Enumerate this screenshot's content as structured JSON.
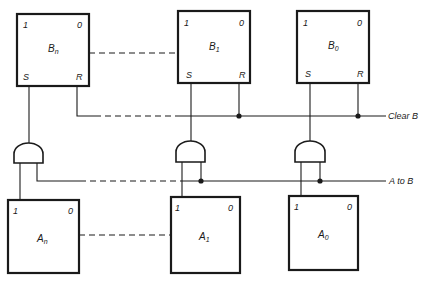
{
  "diagram": {
    "type": "logic-circuit",
    "b_register": [
      {
        "id": "Bn",
        "name": "B",
        "subscript": "n",
        "pin_top_left": "1",
        "pin_top_right": "0",
        "pin_bottom_left": "S",
        "pin_bottom_right": "R"
      },
      {
        "id": "B1",
        "name": "B",
        "subscript": "1",
        "pin_top_left": "1",
        "pin_top_right": "0",
        "pin_bottom_left": "S",
        "pin_bottom_right": "R"
      },
      {
        "id": "B0",
        "name": "B",
        "subscript": "0",
        "pin_top_left": "1",
        "pin_top_right": "0",
        "pin_bottom_left": "S",
        "pin_bottom_right": "R"
      }
    ],
    "a_register": [
      {
        "id": "An",
        "name": "A",
        "subscript": "n",
        "pin_top_left": "1",
        "pin_top_right": "0"
      },
      {
        "id": "A1",
        "name": "A",
        "subscript": "1",
        "pin_top_left": "1",
        "pin_top_right": "0"
      },
      {
        "id": "A0",
        "name": "A",
        "subscript": "0",
        "pin_top_left": "1",
        "pin_top_right": "0"
      }
    ],
    "gates": [
      {
        "id": "AND_n",
        "type": "AND",
        "inputs": [
          "An.1",
          "A to B"
        ],
        "output": "Bn.S"
      },
      {
        "id": "AND_1",
        "type": "AND",
        "inputs": [
          "A1.1",
          "A to B"
        ],
        "output": "B1.S"
      },
      {
        "id": "AND_0",
        "type": "AND",
        "inputs": [
          "A0.1",
          "A to B"
        ],
        "output": "B0.S"
      }
    ],
    "signals": {
      "clear": "Clear B",
      "transfer": "A to B"
    },
    "colors": {
      "ink": "#1a1a1a",
      "background": "#ffffff"
    }
  }
}
